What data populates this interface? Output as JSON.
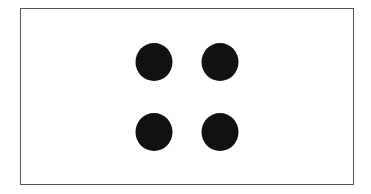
{
  "diagram": {
    "type": "dot-pattern",
    "frame": {
      "border_color": "#555555",
      "fill_color": "#ffffff"
    },
    "dot_color": "#111111",
    "dots": [
      {
        "row": 1,
        "col": 1,
        "cx": 154,
        "cy": 62
      },
      {
        "row": 1,
        "col": 2,
        "cx": 220,
        "cy": 62
      },
      {
        "row": 2,
        "col": 1,
        "cx": 154,
        "cy": 132
      },
      {
        "row": 2,
        "col": 2,
        "cx": 220,
        "cy": 132
      }
    ],
    "dot_count": 4
  }
}
